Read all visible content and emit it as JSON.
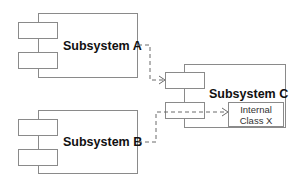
{
  "diagram": {
    "type": "uml-component",
    "subsystems": [
      {
        "id": "A",
        "label": "Subsystem A"
      },
      {
        "id": "B",
        "label": "Subsystem B"
      },
      {
        "id": "C",
        "label": "Subsystem C"
      }
    ],
    "internal_class": {
      "line1": "Internal",
      "line2": "Class X"
    },
    "connections": [
      {
        "from": "Subsystem A",
        "to": "Subsystem C (upper port)",
        "style": "dashed-arrow"
      },
      {
        "from": "Subsystem B",
        "to": "Internal Class X",
        "style": "dashed-arrow"
      }
    ],
    "colors": {
      "stroke": "#8a8a8a",
      "dash": "#6a6a6a",
      "text": "#111111"
    }
  }
}
